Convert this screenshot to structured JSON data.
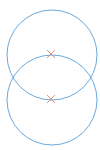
{
  "diagram": {
    "background": "#ffffff",
    "circle_color": "#6aa8dc",
    "marker_color": "#e0917a",
    "circles": [
      {
        "id": "upper",
        "cx": 52,
        "cy": 55,
        "r": 45
      },
      {
        "id": "lower",
        "cx": 52,
        "cy": 100,
        "r": 45
      }
    ],
    "markers": [
      {
        "id": "upper-center",
        "x": 51,
        "y": 54,
        "size": 4
      },
      {
        "id": "lower-center",
        "x": 51,
        "y": 99,
        "size": 4
      }
    ]
  }
}
